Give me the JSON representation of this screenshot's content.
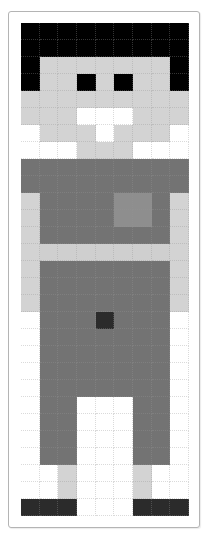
{
  "canvas": {
    "columns": 9,
    "rows": 29,
    "palette": {
      "B": "#000000",
      "L": "#d3d3d3",
      "W": "#ffffff",
      "D": "#737373",
      "M": "#8e8e8e",
      "X": "#2b2b2b",
      "P": "#cfcfcf"
    },
    "pixels": [
      "BBBBBBBBB",
      "BBBBBBBBB",
      "BLLLLLLLB",
      "BLLBLBLLB",
      "LLLLLLLLL",
      "LLLWWWLLL",
      "WLLLWLLLW",
      "WWWLLLWWW",
      "DDDDDDDDD",
      "DDDDDDDDD",
      "LDDDDMMDL",
      "LDDDDMMDL",
      "LDDDDDDDL",
      "LPPPPPPPL",
      "LDDDDDDDL",
      "LDDDDDDDL",
      "LDDDDDDDL",
      "WDDDXDDDW",
      "WDDDDDDDW",
      "WDDDDDDDW",
      "WDDDDDDDW",
      "WDDDDDDDW",
      "WDDWWWDDW",
      "WDDWWWDDW",
      "WDDWWWDDW",
      "WDDWWWDDW",
      "WWLWWWLWW",
      "WWLWWWLWW",
      "XXXWWWXXX"
    ]
  }
}
